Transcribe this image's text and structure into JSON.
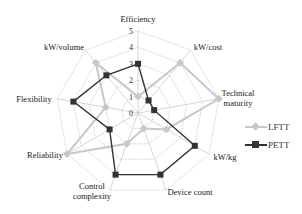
{
  "chart_data": {
    "type": "radar",
    "title": "",
    "axes": [
      "Efficiency",
      "kW/cost",
      "Technical maturity",
      "kW/kg",
      "Device count",
      "Control complexity",
      "Reliability",
      "Flexibility",
      "kW/volume"
    ],
    "axis_labels_display": [
      [
        "Efficiency"
      ],
      [
        "kW/cost"
      ],
      [
        "Technical",
        "maturity"
      ],
      [
        "kW/kg"
      ],
      [
        "Device count"
      ],
      [
        "Control",
        "complexity"
      ],
      [
        "Reliability"
      ],
      [
        "Flexibility"
      ],
      [
        "kW/volume"
      ]
    ],
    "rlim": [
      0,
      5
    ],
    "ticks": [
      0,
      1,
      2,
      3,
      4,
      5
    ],
    "series": [
      {
        "name": "LFTT",
        "values": [
          1,
          4,
          5,
          2,
          1,
          2,
          5,
          2,
          4
        ],
        "color": "#c8c8c8",
        "marker": "diamond"
      },
      {
        "name": "PETT",
        "values": [
          3,
          1,
          1,
          4,
          4,
          4,
          2,
          4,
          3
        ],
        "color": "#333333",
        "marker": "square"
      }
    ],
    "legend_position": "right",
    "grid": true
  },
  "legend": {
    "items": [
      {
        "label": "LFTT",
        "color": "#c8c8c8"
      },
      {
        "label": "PETT",
        "color": "#333333"
      }
    ]
  }
}
